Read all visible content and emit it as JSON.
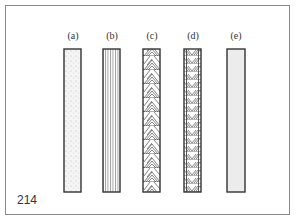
{
  "figure": {
    "number": "214",
    "panels": [
      {
        "label": "(a)",
        "pattern": "stippled-dots",
        "fill": "#f4f4f4"
      },
      {
        "label": "(b)",
        "pattern": "vertical-lines",
        "fill": "#ffffff"
      },
      {
        "label": "(c)",
        "pattern": "diagonal-hatch-herringbone-large",
        "fill": "#ffffff"
      },
      {
        "label": "(d)",
        "pattern": "diagonal-hatch-herringbone-small",
        "fill": "#ffffff"
      },
      {
        "label": "(e)",
        "pattern": "solid-light-gray",
        "fill": "#ececec"
      }
    ],
    "colors": {
      "border": "#333333",
      "frame": "#8a8a8a"
    }
  }
}
